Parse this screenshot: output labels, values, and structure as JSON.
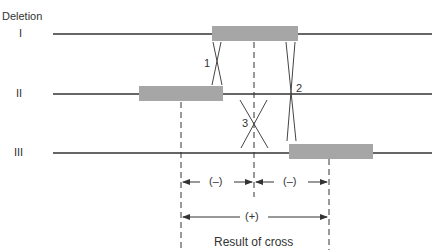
{
  "title": "Deletion",
  "deletions": [
    {
      "label": "I",
      "line_y": 34,
      "box": {
        "x1": 212,
        "x2": 298
      }
    },
    {
      "label": "II",
      "line_y": 94,
      "box": {
        "x1": 139,
        "x2": 223
      }
    },
    {
      "label": "III",
      "line_y": 153,
      "box": {
        "x1": 289,
        "x2": 373
      }
    }
  ],
  "crossovers": [
    {
      "label": "1"
    },
    {
      "label": "2"
    },
    {
      "label": "3"
    }
  ],
  "intervals": [
    {
      "label": "(–)"
    },
    {
      "label": "(–)"
    },
    {
      "label": "(+)"
    }
  ],
  "result_label": "Result of cross",
  "colors": {
    "box": "#a6a6a6",
    "line": "#333333"
  }
}
